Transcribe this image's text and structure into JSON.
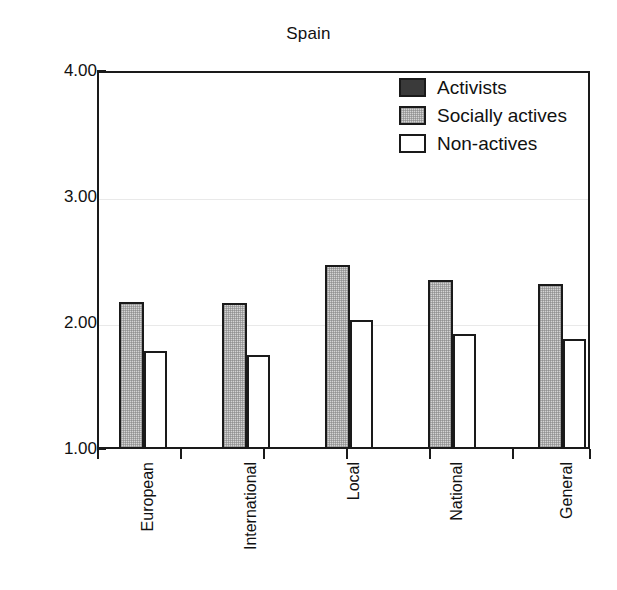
{
  "chart_data": {
    "type": "bar",
    "title": "Spain",
    "xlabel": "",
    "ylabel": "",
    "ylim": [
      1.0,
      4.0
    ],
    "yticks": [
      "1.00",
      "2.00",
      "3.00",
      "4.00"
    ],
    "ytick_values": [
      1.0,
      2.0,
      3.0,
      4.0
    ],
    "grid": true,
    "legend_position": "top-right",
    "categories": [
      "European",
      "International",
      "Local",
      "National",
      "General"
    ],
    "series": [
      {
        "name": "Activists",
        "color": "#3a3a3a",
        "values": [
          null,
          null,
          null,
          null,
          null
        ]
      },
      {
        "name": "Socially actives",
        "color": "#d4d4d4",
        "values": [
          2.17,
          2.16,
          2.46,
          2.34,
          2.31
        ]
      },
      {
        "name": "Non-actives",
        "color": "#ffffff",
        "values": [
          1.78,
          1.75,
          2.02,
          1.91,
          1.87
        ]
      }
    ]
  },
  "title": "Spain",
  "axis": {
    "y_tick_labels": [
      "4.00",
      "3.00",
      "2.00",
      "1.00"
    ]
  },
  "legend": {
    "items": [
      {
        "label": "Activists",
        "swatch": "dark-fill-swatch"
      },
      {
        "label": "Socially actives",
        "swatch": "gray-fill-swatch"
      },
      {
        "label": "Non-actives",
        "swatch": "white-fill-swatch"
      }
    ]
  },
  "x_labels": [
    "European",
    "International",
    "Local",
    "National",
    "General"
  ]
}
